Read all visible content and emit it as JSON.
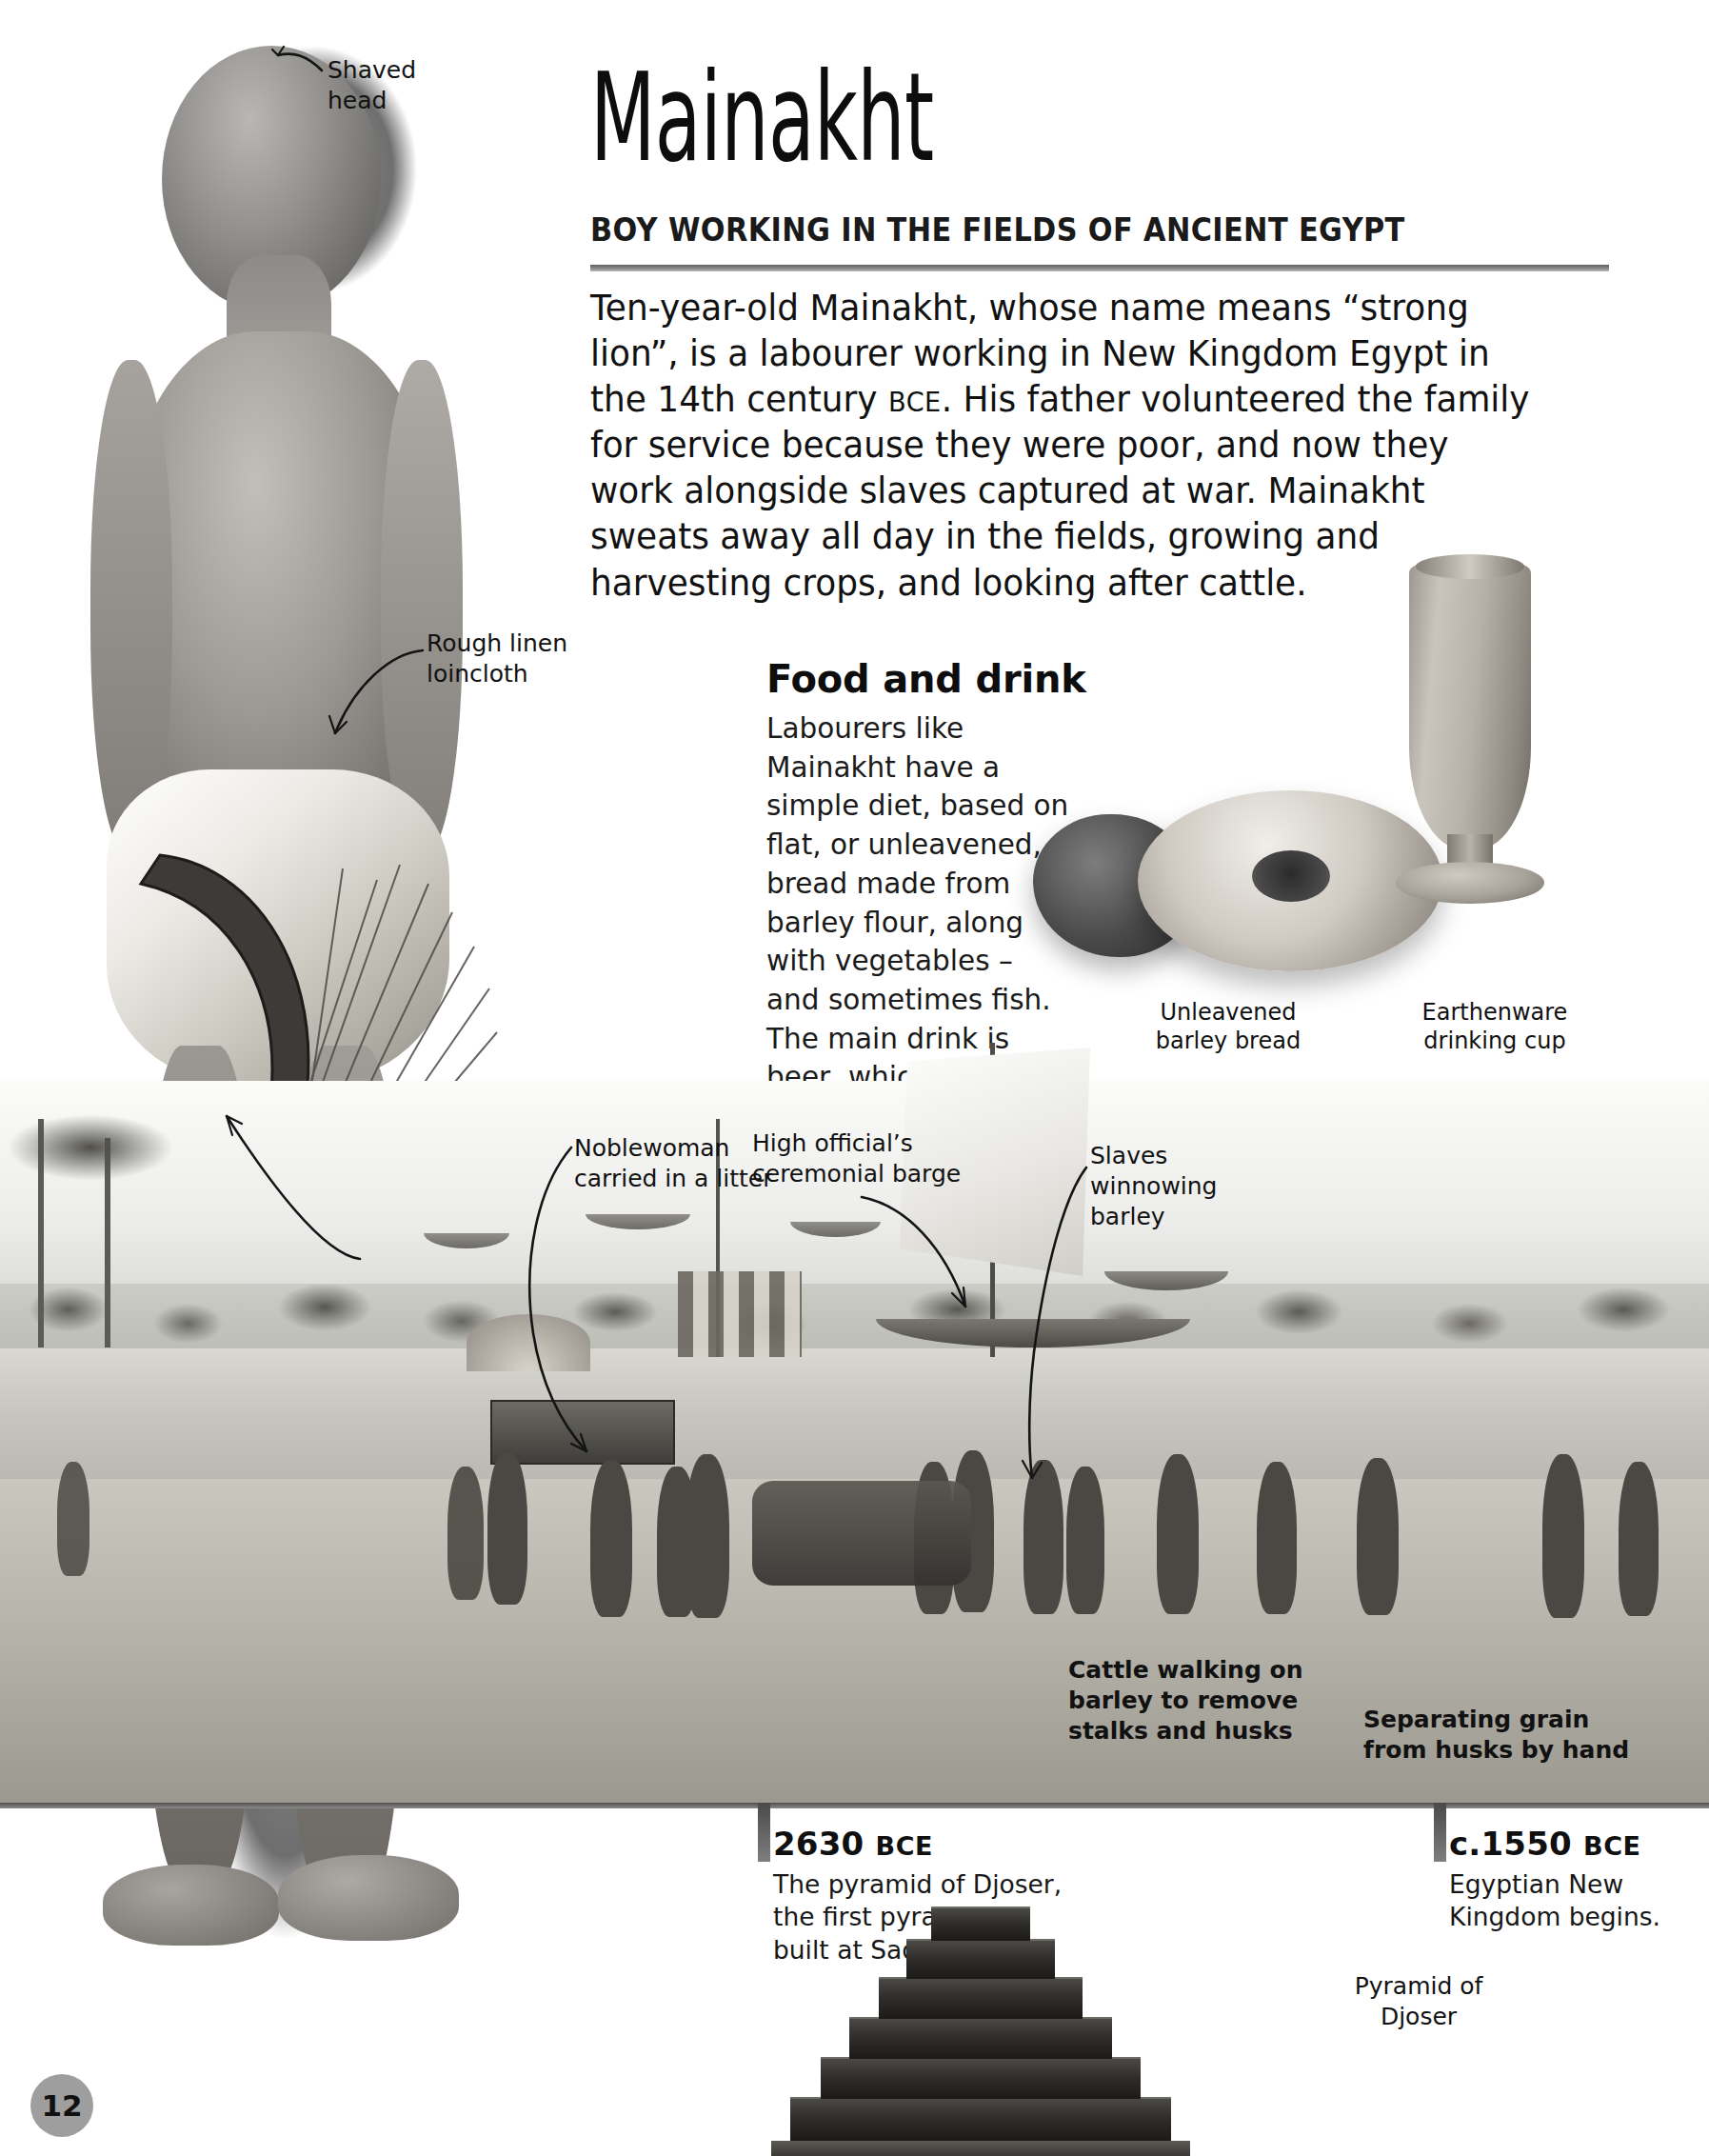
{
  "page": {
    "number": "12",
    "background_color": "#ffffff"
  },
  "header": {
    "title": "Mainakht",
    "subtitle": "BOY WORKING IN THE FIELDS OF ANCIENT EGYPT",
    "rule_color": "#7a7a7a"
  },
  "intro": {
    "part1": "Ten-year-old Mainakht, whose name means “strong lion”, is a labourer working in New Kingdom Egypt in the 14th century ",
    "era": "BCE",
    "part2": ". His father volunteered the family for service because they were poor, and now they work alongside slaves captured at war. Mainakht sweats away all day in the fields, growing and harvesting crops, and looking after cattle."
  },
  "food_and_drink": {
    "heading": "Food and drink",
    "body": "Labourers like Mainakht have a simple diet, based on flat, or unleavened, bread made from barley flour, along with vegetables – and sometimes fish. The main drink is beer, which is also made from barley."
  },
  "object_captions": {
    "bread": "Unleavened\nbarley bread",
    "cup": "Earthenware\ndrinking cup"
  },
  "figure_callouts": {
    "shaved_head": "Shaved\nhead",
    "loincloth": "Rough linen\nloincloth",
    "sickle": "Wooden sickle\nwith sharp\nflint blade for\ncutting barley"
  },
  "scene_callouts": {
    "noblewoman": "Noblewoman\ncarried in a litter",
    "barge": "High official’s\nceremonial barge",
    "winnowing": "Slaves\nwinnowing\nbarley",
    "cattle": "Cattle walking on\nbarley to remove\nstalks and husks",
    "separating": "Separating grain\nfrom husks by hand"
  },
  "timeline": {
    "entries": [
      {
        "date": "2630",
        "era": "BCE",
        "body": "The pyramid of Djoser,\nthe first pyramid, is\nbuilt at Saqqara."
      },
      {
        "date": "c.1550",
        "era": "BCE",
        "body": "Egyptian New\nKingdom begins."
      }
    ],
    "pyramid_caption": "Pyramid of\nDjoser"
  },
  "icons": {
    "leader_line": "leader-line-icon",
    "timeline_tick": "timeline-tick-icon"
  }
}
